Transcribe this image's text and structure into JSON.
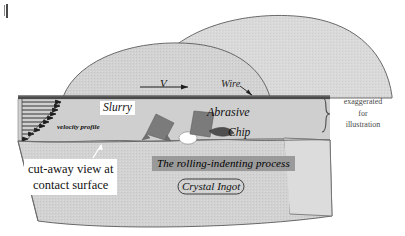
{
  "figure": {
    "labels": {
      "slurry": "Slurry",
      "abrasive": "Abrasive",
      "chip": "Chip",
      "wire": "Wire",
      "velocity_symbol": "V",
      "velocity_profile": "velocity profile",
      "exaggerated_line1": "exaggerated",
      "exaggerated_line2": "for",
      "exaggerated_line3": "illustration",
      "cutaway_line1": "cut-away view at",
      "cutaway_line2": "contact surface",
      "process": "The rolling-indenting process",
      "ingot": "Crystal Ingot"
    },
    "colors": {
      "ingot_fill": "#d8d8d8",
      "slurry_fill": "#cfcfcf",
      "abrasive_fill": "#7b7b7b",
      "wire": "#4a4a4a",
      "band": "#9a9a9a",
      "outline": "#555555",
      "dimple": "#ffffff"
    },
    "velocity_profile_arrows": 10
  }
}
